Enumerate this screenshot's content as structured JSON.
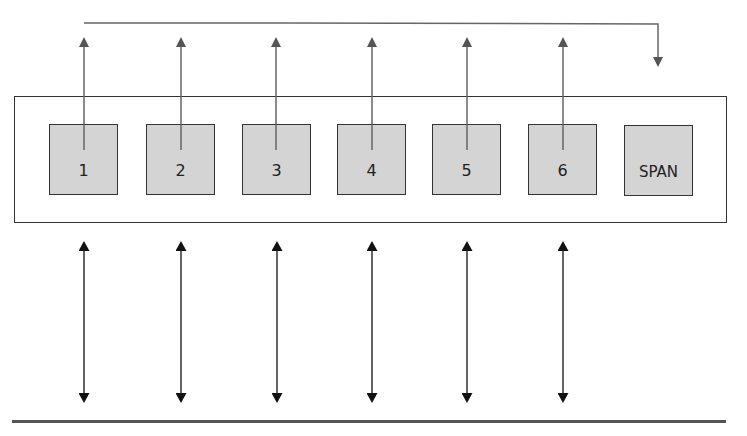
{
  "diagram": {
    "type": "port-mirroring",
    "switch": {
      "label": ""
    },
    "ports": [
      {
        "id": "p1",
        "label": "1",
        "x": 49,
        "mirrored": true
      },
      {
        "id": "p2",
        "label": "2",
        "x": 146,
        "mirrored": true
      },
      {
        "id": "p3",
        "label": "3",
        "x": 242,
        "mirrored": true
      },
      {
        "id": "p4",
        "label": "4",
        "x": 337,
        "mirrored": true
      },
      {
        "id": "p5",
        "label": "5",
        "x": 432,
        "mirrored": true
      },
      {
        "id": "p6",
        "label": "6",
        "x": 528,
        "mirrored": true
      },
      {
        "id": "span",
        "label": "SPAN",
        "x": 624,
        "mirrored": false
      }
    ],
    "colors": {
      "port_fill": "#d4d4d4",
      "outline": "#333333",
      "mirror_arrow": "#555555",
      "link_arrow": "#111111"
    }
  }
}
